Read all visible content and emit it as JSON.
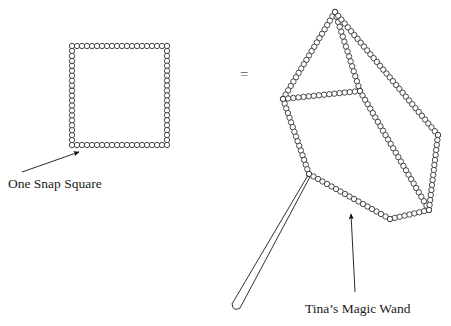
{
  "figure": {
    "equals_symbol": "=",
    "colors": {
      "bead_stroke": "#2b2b2b",
      "bead_fill": "#ffffff",
      "line": "#1a1a1a",
      "background": "#ffffff",
      "equals": "#5a5a5a",
      "text": "#1a1a1a"
    },
    "labels": {
      "snap_square": "One Snap Square",
      "magic_wand": "Tina’s Magic Wand"
    },
    "shapes": {
      "snap_square": {
        "name": "snap-square",
        "description": "Square outlined with snap beads",
        "corners": [
          [
            72,
            46
          ],
          [
            167,
            46
          ],
          [
            167,
            145
          ],
          [
            72,
            145
          ]
        ],
        "beads_per_side": 20,
        "bead_radius": 2.7
      },
      "cube": {
        "name": "bead-cube",
        "description": "Wireframe cube outlined with snap beads",
        "vertices": {
          "top": [
            335,
            12
          ],
          "upper_left": [
            283,
            99
          ],
          "center": [
            360,
            91
          ],
          "right": [
            438,
            135
          ],
          "lower_left": [
            309,
            174
          ],
          "bottom": [
            390,
            219
          ],
          "far_right": [
            429,
            210
          ]
        },
        "edges": [
          [
            "top",
            "upper_left"
          ],
          [
            "top",
            "center"
          ],
          [
            "top",
            "right"
          ],
          [
            "center",
            "upper_left"
          ],
          [
            "center",
            "far_right"
          ],
          [
            "upper_left",
            "lower_left"
          ],
          [
            "lower_left",
            "bottom"
          ],
          [
            "bottom",
            "far_right"
          ],
          [
            "right",
            "far_right"
          ]
        ],
        "bead_radius": 2.7
      },
      "magic_wand": {
        "name": "magic-wand",
        "description": "Long tapered wand attached to cube lower-left vertex",
        "tip": [
          309,
          176
        ],
        "end": [
          236,
          306
        ],
        "half_width": 4.5
      }
    },
    "annotations": [
      {
        "name": "snap-square-arrow",
        "from": [
          22,
          172
        ],
        "to": [
          79,
          152
        ],
        "label": "One Snap Square"
      },
      {
        "name": "magic-wand-arrow",
        "from": [
          355,
          292
        ],
        "to": [
          351,
          214
        ],
        "label": "Tina’s Magic Wand"
      }
    ]
  }
}
